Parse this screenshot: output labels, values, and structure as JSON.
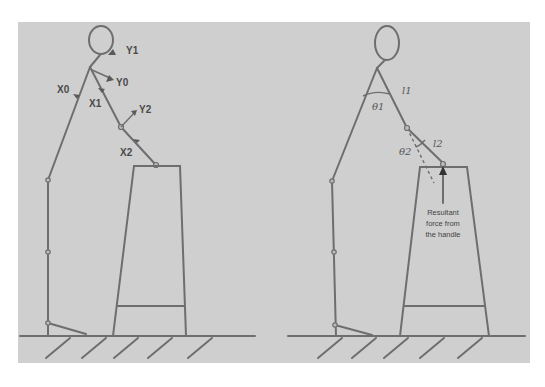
{
  "figure": {
    "background_color": "#ffffff",
    "panel_color": "#cfcfcf",
    "line_color": "#6e6e6e"
  },
  "left_panel": {
    "description": "Stick figure pushing a cart handle with coordinate frames",
    "labels": {
      "y1": "Y1",
      "y0": "Y0",
      "x0": "X0",
      "x1": "X1",
      "y2": "Y2",
      "x2": "X2"
    }
  },
  "right_panel": {
    "description": "Stick figure with arm segment lengths, joint angles and handle force",
    "labels": {
      "l1": "l1",
      "l2": "l2",
      "theta1": "θ1",
      "theta2": "θ2"
    },
    "force_note": [
      "Resultant",
      "force from",
      "the handle"
    ]
  }
}
